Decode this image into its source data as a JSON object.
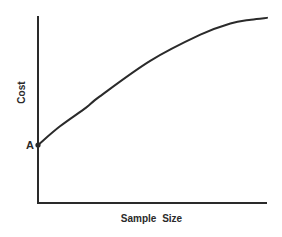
{
  "chart_data": {
    "type": "line",
    "title": "",
    "xlabel": "Sample Size",
    "ylabel": "Cost",
    "xlim": [
      0,
      1
    ],
    "ylim": [
      0,
      1
    ],
    "grid": false,
    "legend": null,
    "ticks": {
      "x": [],
      "y": []
    },
    "annotations": [
      {
        "label": "A",
        "x": 0,
        "y": 0.31,
        "description": "fixed cost intercept on the Cost axis"
      }
    ],
    "series": [
      {
        "name": "Cost",
        "x": [
          0,
          0.096,
          0.21,
          0.27,
          0.49,
          0.709,
          0.84,
          0.93,
          1.0
        ],
        "y": [
          0.31,
          0.41,
          0.51,
          0.57,
          0.76,
          0.9,
          0.96,
          0.98,
          0.99
        ]
      }
    ]
  },
  "style": {
    "line_color": "#2a2a2a",
    "axis_color": "#2a2a2a",
    "background": "#ffffff"
  },
  "layout": {
    "plot_left": 38,
    "plot_right": 267,
    "plot_top": 16,
    "plot_bottom": 203
  }
}
